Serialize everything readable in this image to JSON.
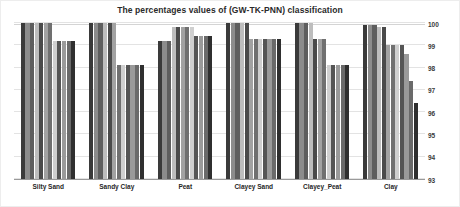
{
  "chart": {
    "title": "The percentages values of (GW-TK-PNN) classification"
  },
  "axes": {
    "y_ticks": [
      "100",
      "99",
      "98",
      "97",
      "96",
      "95",
      "94",
      "93"
    ],
    "x_labels": [
      "Silty Sand",
      "Sandy Clay",
      "Peat",
      "Clayey Sand",
      "Clayey_Peat",
      "Clay"
    ]
  },
  "chart_data": {
    "type": "bar",
    "title": "The percentages values of (GW-TK-PNN) classification",
    "xlabel": "",
    "ylabel": "",
    "ylim": [
      93,
      100
    ],
    "yticks": [
      93,
      94,
      95,
      96,
      97,
      98,
      99,
      100
    ],
    "grid": true,
    "legend": "none",
    "categories": [
      "Silty Sand",
      "Sandy Clay",
      "Peat",
      "Clayey Sand",
      "Clayey_Peat",
      "Clay"
    ],
    "groups": [
      {
        "category": "Silty Sand",
        "values": [
          100,
          100,
          100,
          100,
          100,
          100,
          100,
          99.2,
          99.2,
          99.2,
          99.2,
          99.2
        ]
      },
      {
        "category": "Sandy Clay",
        "values": [
          100,
          100,
          100,
          100,
          100,
          100,
          98.1,
          98.1,
          98.1,
          98.1,
          98.1,
          98.1
        ]
      },
      {
        "category": "Peat",
        "values": [
          99.2,
          99.2,
          99.2,
          99.8,
          99.8,
          99.8,
          99.8,
          99.8,
          99.4,
          99.4,
          99.4,
          99.4
        ]
      },
      {
        "category": "Clayey Sand",
        "values": [
          100,
          100,
          100,
          100,
          100,
          99.3,
          99.3,
          99.3,
          99.3,
          99.3,
          99.3,
          99.3
        ]
      },
      {
        "category": "Clayey_Peat",
        "values": [
          100,
          100,
          100,
          100,
          99.3,
          99.3,
          99.3,
          98.1,
          98.1,
          98.1,
          98.1,
          98.1
        ]
      },
      {
        "category": "Clay",
        "values": [
          99.9,
          99.9,
          99.9,
          99.8,
          99.8,
          99.0,
          99.0,
          99.0,
          99.0,
          98.6,
          97.4,
          96.4
        ]
      }
    ],
    "bar_shades": [
      "#3a3a3a",
      "#8c8c8c",
      "#5e5e5e",
      "#bdbdbd",
      "#4a4a4a",
      "#a2a2a2",
      "#707070",
      "#cfcfcf",
      "#555555",
      "#9a9a9a",
      "#6a6a6a",
      "#2f2f2f"
    ]
  }
}
